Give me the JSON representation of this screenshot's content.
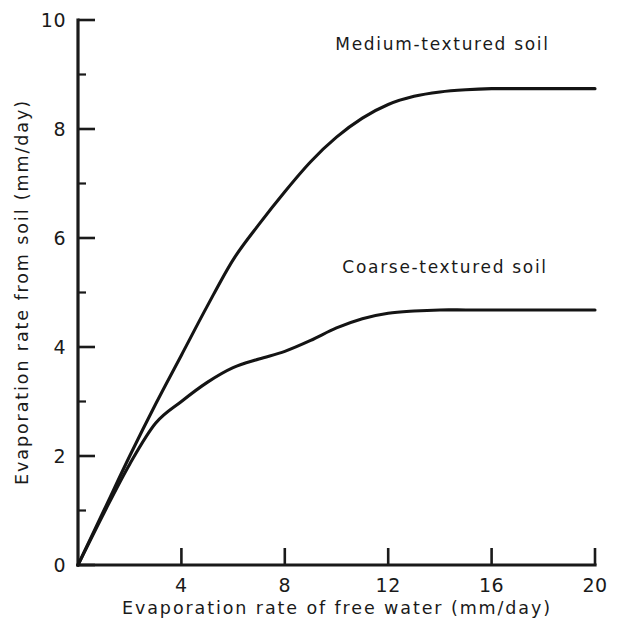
{
  "chart_data": {
    "type": "line",
    "title": "",
    "xlabel": "Evaporation rate of free water (mm/day)",
    "ylabel": "Evaporation rate from soil (mm/day)",
    "xlim": [
      0,
      20
    ],
    "ylim": [
      0,
      10
    ],
    "grid": false,
    "legend_position": "inline-annotations",
    "x_ticks": [
      0,
      4,
      8,
      12,
      16,
      20
    ],
    "x_tick_labels": [
      "0",
      "4",
      "8",
      "12",
      "16",
      "20"
    ],
    "y_ticks": [
      0,
      2,
      4,
      6,
      8,
      10
    ],
    "y_tick_labels": [
      "0",
      "2",
      "4",
      "6",
      "8",
      "10"
    ],
    "y_minor_ticks": [
      1,
      3,
      5,
      7,
      9
    ],
    "x": [
      0,
      1,
      2,
      3,
      4,
      5,
      6,
      7,
      8,
      9,
      10,
      11,
      12,
      13,
      14,
      15,
      16,
      17,
      18,
      19,
      20
    ],
    "series": [
      {
        "name": "Medium-textured soil",
        "values": [
          0.0,
          1.0,
          2.0,
          2.95,
          3.85,
          4.75,
          5.6,
          6.25,
          6.85,
          7.4,
          7.85,
          8.2,
          8.45,
          8.6,
          8.68,
          8.72,
          8.74,
          8.74,
          8.74,
          8.74,
          8.74
        ],
        "annotation": "Medium-textured soil",
        "annotation_x": 14.1,
        "annotation_y": 9.45
      },
      {
        "name": "Coarse-textured soil",
        "values": [
          0.0,
          0.95,
          1.85,
          2.6,
          3.0,
          3.35,
          3.62,
          3.78,
          3.92,
          4.12,
          4.35,
          4.52,
          4.62,
          4.66,
          4.68,
          4.68,
          4.68,
          4.68,
          4.68,
          4.68,
          4.68
        ],
        "annotation": "Coarse-textured soil",
        "annotation_x": 14.2,
        "annotation_y": 5.35
      }
    ],
    "colors": {
      "axis": "#1a1a1a",
      "curve": "#141414",
      "background": "#ffffff"
    }
  }
}
